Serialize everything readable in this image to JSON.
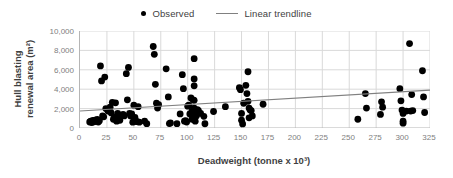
{
  "legend": {
    "position": "top-center",
    "entries": [
      {
        "label": "Observed",
        "marker": "dot",
        "color": "#000000"
      },
      {
        "label": "Linear trendline",
        "marker": "line",
        "color": "#808080"
      }
    ]
  },
  "axis_titles": {
    "y_line1": "Hull blasting",
    "y_line2": "renewal area (m²)",
    "x": "Deadweight (tonne x 10³)"
  },
  "chart_data": {
    "type": "scatter",
    "title": "",
    "xlabel": "Deadweight (tonne x 10³)",
    "ylabel": "Hull blasting renewal area (m²)",
    "xlim": [
      0,
      325
    ],
    "ylim": [
      0,
      10000
    ],
    "xticks": [
      0,
      25,
      50,
      75,
      100,
      125,
      150,
      175,
      200,
      225,
      250,
      275,
      300,
      325
    ],
    "ytciks_note": "major every 2000",
    "yticks": [
      0,
      2000,
      4000,
      6000,
      8000,
      10000
    ],
    "xtick_labels": [
      "0",
      "25",
      "50",
      "75",
      "100",
      "125",
      "150",
      "175",
      "200",
      "225",
      "250",
      "275",
      "300",
      "325"
    ],
    "ytick_labels": [
      "0",
      "2,000",
      "4,000",
      "6,000",
      "8,000",
      "10,000"
    ],
    "grid": true,
    "grid_color": "#d9d9d9",
    "series": [
      {
        "name": "Observed",
        "type": "scatter",
        "color": "#000000",
        "marker_size": 3.4,
        "points": [
          [
            9,
            620
          ],
          [
            10,
            700
          ],
          [
            11,
            560
          ],
          [
            12,
            780
          ],
          [
            13,
            640
          ],
          [
            14,
            820
          ],
          [
            15,
            700
          ],
          [
            16,
            880
          ],
          [
            17,
            620
          ],
          [
            18,
            760
          ],
          [
            19,
            6400
          ],
          [
            20,
            4850
          ],
          [
            21,
            1250
          ],
          [
            22,
            1150
          ],
          [
            23,
            5250
          ],
          [
            24,
            2000
          ],
          [
            26,
            1750
          ],
          [
            28,
            2150
          ],
          [
            29,
            1550
          ],
          [
            30,
            2650
          ],
          [
            31,
            900
          ],
          [
            32,
            1100
          ],
          [
            33,
            2600
          ],
          [
            34,
            700
          ],
          [
            35,
            1500
          ],
          [
            36,
            1150
          ],
          [
            37,
            800
          ],
          [
            40,
            1400
          ],
          [
            41,
            1250
          ],
          [
            43,
            5600
          ],
          [
            44,
            2900
          ],
          [
            45,
            6250
          ],
          [
            46,
            1500
          ],
          [
            47,
            1250
          ],
          [
            48,
            1450
          ],
          [
            49,
            600
          ],
          [
            50,
            2350
          ],
          [
            51,
            1100
          ],
          [
            52,
            700
          ],
          [
            53,
            650
          ],
          [
            54,
            2200
          ],
          [
            55,
            600
          ],
          [
            60,
            700
          ],
          [
            62,
            450
          ],
          [
            68,
            8400
          ],
          [
            69,
            7600
          ],
          [
            70,
            4500
          ],
          [
            71,
            2550
          ],
          [
            72,
            2050
          ],
          [
            73,
            2400
          ],
          [
            80,
            6100
          ],
          [
            82,
            3200
          ],
          [
            83,
            460
          ],
          [
            84,
            520
          ],
          [
            90,
            450
          ],
          [
            93,
            1450
          ],
          [
            95,
            5500
          ],
          [
            96,
            4050
          ],
          [
            97,
            700
          ],
          [
            98,
            760
          ],
          [
            99,
            620
          ],
          [
            100,
            2250
          ],
          [
            101,
            2350
          ],
          [
            102,
            1450
          ],
          [
            103,
            3100
          ],
          [
            104,
            1750
          ],
          [
            104,
            900
          ],
          [
            105,
            2900
          ],
          [
            105,
            1650
          ],
          [
            106,
            7150
          ],
          [
            106,
            5050
          ],
          [
            106,
            4350
          ],
          [
            106,
            2850
          ],
          [
            106,
            2050
          ],
          [
            107,
            1850
          ],
          [
            107,
            1400
          ],
          [
            107,
            700
          ],
          [
            108,
            1700
          ],
          [
            108,
            1250
          ],
          [
            109,
            1900
          ],
          [
            110,
            1800
          ],
          [
            112,
            1500
          ],
          [
            115,
            1200
          ],
          [
            116,
            440
          ],
          [
            124,
            1700
          ],
          [
            135,
            2200
          ],
          [
            148,
            4150
          ],
          [
            149,
            3950
          ],
          [
            150,
            1500
          ],
          [
            150,
            800
          ],
          [
            151,
            420
          ],
          [
            152,
            2550
          ],
          [
            154,
            4400
          ],
          [
            155,
            3550
          ],
          [
            156,
            5800
          ],
          [
            156,
            2750
          ],
          [
            157,
            2050
          ],
          [
            157,
            1050
          ],
          [
            158,
            1850
          ],
          [
            159,
            1800
          ],
          [
            160,
            1250
          ],
          [
            170,
            2450
          ],
          [
            258,
            900
          ],
          [
            265,
            3550
          ],
          [
            266,
            2050
          ],
          [
            279,
            1400
          ],
          [
            280,
            2700
          ],
          [
            281,
            2150
          ],
          [
            297,
            4050
          ],
          [
            298,
            2800
          ],
          [
            299,
            1850
          ],
          [
            300,
            1500
          ],
          [
            300,
            700
          ],
          [
            300,
            500
          ],
          [
            303,
            1750
          ],
          [
            306,
            8700
          ],
          [
            307,
            1750
          ],
          [
            308,
            3450
          ],
          [
            309,
            1800
          ],
          [
            318,
            5900
          ],
          [
            319,
            3200
          ],
          [
            320,
            1600
          ]
        ]
      },
      {
        "name": "Linear trendline",
        "type": "line",
        "color": "#808080",
        "endpoints": [
          [
            0,
            1750
          ],
          [
            325,
            3900
          ]
        ],
        "slope": 6.6,
        "intercept": 1750
      }
    ]
  }
}
